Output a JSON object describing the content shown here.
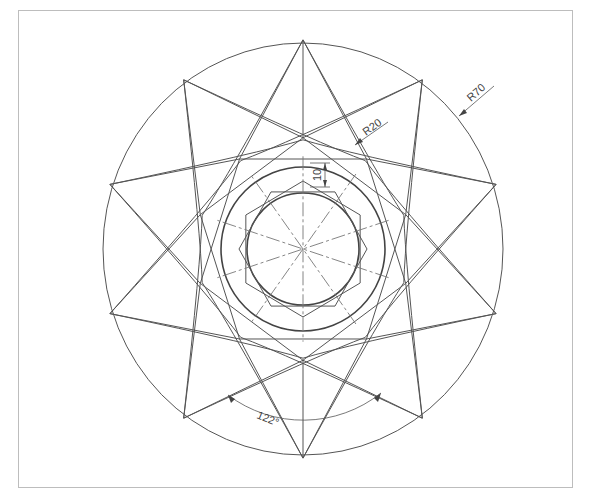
{
  "drawing": {
    "center": [
      303,
      249
    ],
    "outer_circle": {
      "rx": 200,
      "ry": 206
    },
    "middle_circle_r": 82,
    "inner_circle_r": 56,
    "star_points": 10,
    "star_tip_r": 203,
    "star_inner_r": 108,
    "hexagon_pointy_r": 66,
    "hexagon_flat_r": 64,
    "line_color": "#555555"
  },
  "dimensions": {
    "outer_radius": "R70",
    "fillet_radius": "R20",
    "offset": "10",
    "angle": "122°"
  }
}
